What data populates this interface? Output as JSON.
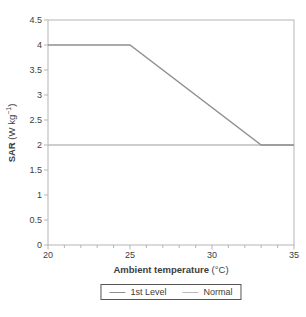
{
  "chart_data": {
    "type": "line",
    "title": "",
    "xlabel_bold": "Ambient temperature",
    "xlabel_unit": " (°C)",
    "ylabel_bold": "SAR",
    "ylabel_unit_pre": " (W kg",
    "ylabel_sup": "−1",
    "ylabel_unit_post": ")",
    "xlim": [
      20,
      35
    ],
    "ylim": [
      0,
      4.5
    ],
    "x_major_ticks": [
      20,
      25,
      30,
      35
    ],
    "x_minor_ticks": [
      21,
      22,
      23,
      24,
      26,
      27,
      28,
      29,
      31,
      32,
      33,
      34
    ],
    "y_ticks": [
      0,
      0.5,
      1,
      1.5,
      2,
      2.5,
      3,
      3.5,
      4,
      4.5
    ],
    "grid": false,
    "legend_position": "bottom",
    "axis_color": "#b5b5b5",
    "tick_label_color": "#3d3d3d",
    "series": [
      {
        "name": "1st Level",
        "color": "#8f8f8f",
        "points": [
          [
            20,
            4
          ],
          [
            25,
            4
          ],
          [
            33,
            2
          ],
          [
            35,
            2
          ]
        ]
      },
      {
        "name": "Normal",
        "color": "#bcbcbc",
        "points": [
          [
            20,
            2
          ],
          [
            35,
            2
          ]
        ]
      }
    ]
  }
}
